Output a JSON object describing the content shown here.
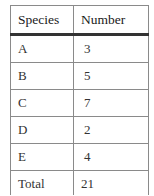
{
  "table": {
    "headers": [
      "Species",
      "Number"
    ],
    "rows": [
      {
        "species": "A",
        "number": "3"
      },
      {
        "species": "B",
        "number": "5"
      },
      {
        "species": "C",
        "number": "7"
      },
      {
        "species": "D",
        "number": "2"
      },
      {
        "species": "E",
        "number": "4"
      }
    ],
    "total": {
      "label": "Total",
      "value": "21"
    }
  }
}
